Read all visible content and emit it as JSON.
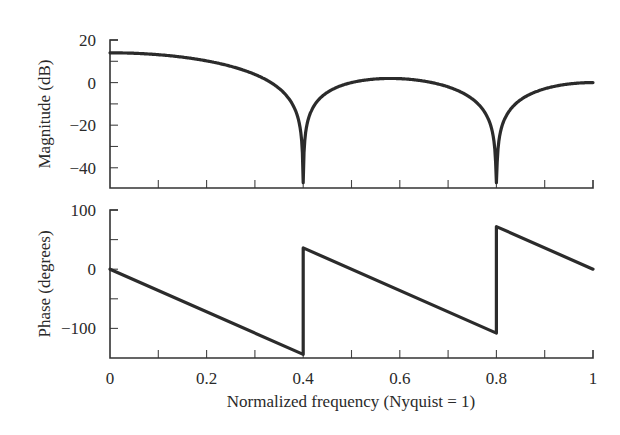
{
  "chart_data": [
    {
      "type": "line",
      "title": "",
      "xlabel": "",
      "ylabel": "Magnitude (dB)",
      "xlim": [
        0,
        1
      ],
      "ylim": [
        -49.5,
        20
      ],
      "yticks": [
        20,
        0,
        -20,
        -40
      ],
      "yticks_minor": [
        10,
        -10,
        -30
      ],
      "xticks": [
        0,
        0.1,
        0.2,
        0.3,
        0.4,
        0.5,
        0.6,
        0.7,
        0.8,
        0.9,
        1
      ],
      "grid": false,
      "x": [
        0,
        0.05,
        0.1,
        0.15,
        0.2,
        0.25,
        0.3,
        0.35,
        0.4,
        0.45,
        0.5,
        0.55,
        0.6,
        0.65,
        0.7,
        0.75,
        0.8,
        0.85,
        0.9,
        0.95,
        1
      ],
      "series": [
        {
          "name": "Magnitude",
          "values": [
            13.98,
            13.76,
            13.1,
            11.95,
            10.2,
            7.66,
            3.85,
            -2.7,
            -47,
            -4.6,
            0.0,
            1.69,
            1.84,
            0.69,
            -2.01,
            -7.66,
            -47,
            -8.1,
            -2.9,
            -0.66,
            0.0
          ]
        }
      ],
      "annotations": [
        "Deep nulls at 0.4 and 0.8"
      ]
    },
    {
      "type": "line",
      "title": "",
      "xlabel": "Normalized frequency (Nyquist = 1)",
      "ylabel": "Phase (degrees)",
      "xlim": [
        0,
        1
      ],
      "ylim": [
        -150,
        100
      ],
      "yticks": [
        100,
        0,
        -100
      ],
      "yticks_minor": [
        50,
        -50
      ],
      "xticks": [
        0,
        0.2,
        0.4,
        0.6,
        0.8,
        1
      ],
      "grid": false,
      "x": [
        0,
        0.4,
        0.4,
        0.8,
        0.8,
        1
      ],
      "series": [
        {
          "name": "Phase",
          "values": [
            0,
            -144,
            36,
            -108,
            72,
            0
          ]
        }
      ]
    }
  ],
  "labels": {
    "mag_ylabel": "Magnitude (dB)",
    "phase_ylabel": "Phase (degrees)",
    "xlabel": "Normalized frequency (Nyquist = 1)",
    "mag_yticks": [
      "20",
      "0",
      "-20",
      "-40"
    ],
    "phase_yticks": [
      "100",
      "0",
      "-100"
    ],
    "xticks": [
      "0",
      "0.2",
      "0.4",
      "0.6",
      "0.8",
      "1"
    ]
  }
}
